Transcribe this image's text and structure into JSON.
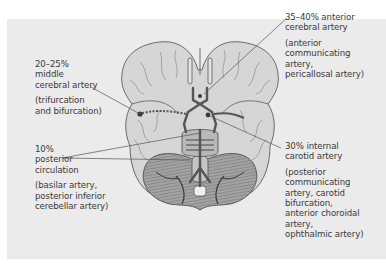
{
  "figure": {
    "labels": [
      {
        "id": "mca",
        "percent_title": "20–25%",
        "title": "middle cerebral artery",
        "title_lines": [
          "20–25%",
          "middle",
          "cerebral artery"
        ],
        "detail_lines": [
          "(trifurcation",
          "and bifurcation)"
        ]
      },
      {
        "id": "posterior",
        "title_lines": [
          "10%",
          "posterior",
          "circulation"
        ],
        "detail_lines": [
          "(basilar artery,",
          "posterior inferior",
          "cerebellar artery)"
        ]
      },
      {
        "id": "aca",
        "title_lines": [
          "35–40% anterior",
          "cerebral artery"
        ],
        "detail_lines": [
          "(anterior",
          "communicating",
          "artery,",
          "pericallosal artery)"
        ]
      },
      {
        "id": "ica",
        "title_lines": [
          "30% internal",
          "carotid artery"
        ],
        "detail_lines": [
          "(posterior",
          "communicating",
          "artery, carotid",
          "bifurcation,",
          "anterior choroidal",
          "artery,",
          "ophthalmic artery)"
        ]
      }
    ],
    "colors": {
      "panel": "#ebebeb",
      "brain_fill": "#d6d6d6",
      "brain_outline": "#6a6a6a",
      "cerebellum_fill": "#9a9a9a",
      "vessel": "#555555",
      "text": "#3a3a3a",
      "leader": "#555555"
    }
  }
}
